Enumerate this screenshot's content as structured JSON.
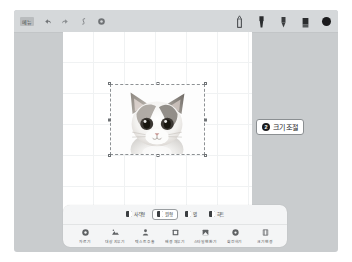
{
  "app": {
    "top_toolbar": {
      "menu_label": "메뉴",
      "left_icons": [
        {
          "name": "undo-icon",
          "glyph": "undo"
        },
        {
          "name": "redo-icon",
          "glyph": "redo"
        },
        {
          "name": "text-style-icon",
          "glyph": "italic"
        },
        {
          "name": "settings-icon",
          "glyph": "gear"
        }
      ],
      "pen_tools": [
        {
          "name": "pen-tool-icon",
          "label": "펜"
        },
        {
          "name": "marker-tool-icon",
          "label": "마커"
        },
        {
          "name": "highlighter-tool-icon",
          "label": "형광펜"
        },
        {
          "name": "eraser-tool-icon",
          "label": "지우개"
        }
      ],
      "color_swatch": {
        "name": "color-swatch",
        "color": "#1b1b1d"
      }
    },
    "callouts": [
      {
        "badge": "1",
        "text": "탭"
      },
      {
        "badge": "2",
        "text": "크기 조절"
      }
    ],
    "bottom_panel": {
      "segmented_control": {
        "selected_index": 1,
        "options": [
          {
            "label": "사각형"
          },
          {
            "label": "원형"
          },
          {
            "label": "별"
          },
          {
            "label": "하트"
          }
        ]
      },
      "tools": [
        {
          "name": "tool-crop",
          "label": "자르기",
          "glyph": "gear"
        },
        {
          "name": "tool-extract",
          "label": "대상 지우기",
          "glyph": "mountain"
        },
        {
          "name": "tool-text",
          "label": "텍스트 추출",
          "glyph": "person"
        },
        {
          "name": "tool-fill",
          "label": "배경 채우기",
          "glyph": "square"
        },
        {
          "name": "tool-brightness",
          "label": "스타일 변환기",
          "glyph": "square2"
        },
        {
          "name": "tool-rotate",
          "label": "회전하기",
          "glyph": "gear2"
        },
        {
          "name": "tool-resize",
          "label": "크기 변경",
          "glyph": "shape"
        }
      ]
    },
    "canvas": {
      "selected_object": "cat-photo",
      "selection_handles": 8
    }
  }
}
